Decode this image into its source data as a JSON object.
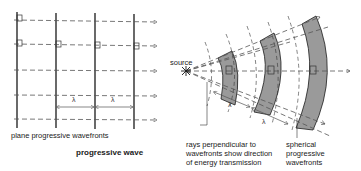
{
  "labels": {
    "plane_wavefronts": "plane progressive wavefronts",
    "title": "progressive wave",
    "source": "source",
    "rays_line1": "rays perpendicular to",
    "rays_line2": "wavefronts show direction",
    "rays_line3": "of energy transmission",
    "spherical_line1": "spherical",
    "spherical_line2": "progressive",
    "spherical_line3": "wavefronts",
    "lambda": "λ"
  },
  "colors": {
    "line": "#1a1a1a",
    "dash": "#555555",
    "shade": "#9a9a9a"
  }
}
